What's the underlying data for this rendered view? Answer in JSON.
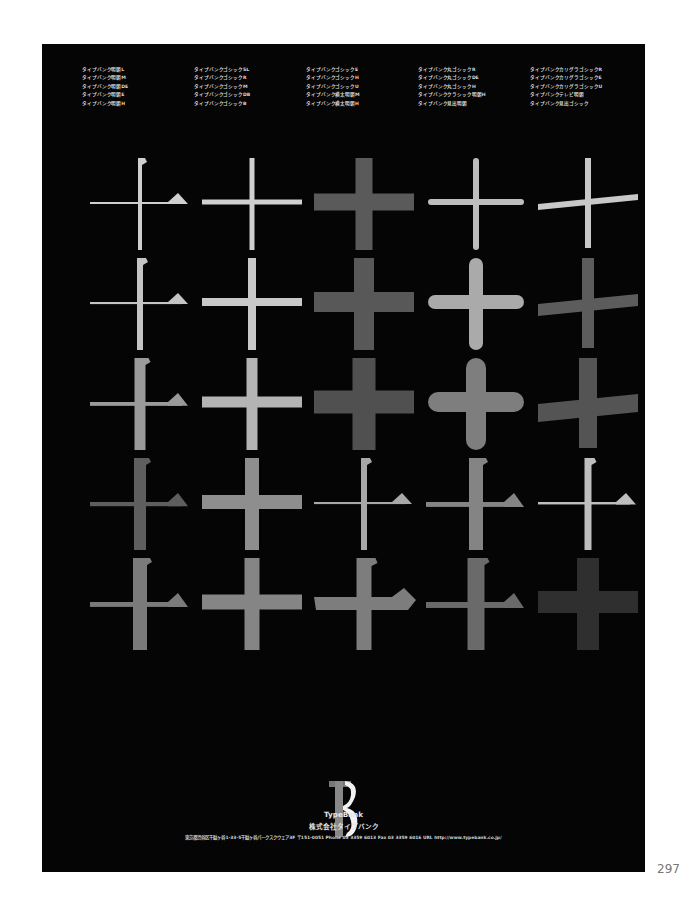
{
  "font_name_columns": [
    [
      "タイプバンク明朝L",
      "タイプバンク明朝M",
      "タイプバンク明朝DE",
      "タイプバンク明朝E",
      "タイプバンク明朝H"
    ],
    [
      "タイプバンクゴシックSL",
      "タイプバンクゴシックR",
      "タイプバンクゴシックM",
      "タイプバンクゴシックDB",
      "タイプバンクゴシックB"
    ],
    [
      "タイプバンクゴシックE",
      "タイプバンクゴシックH",
      "タイプバンクゴシックU",
      "タイプバンク横太明朝M",
      "タイプバンク横太明朝H"
    ],
    [
      "タイプバンク丸ゴシックR",
      "タイプバンク丸ゴシックDE",
      "タイプバンク丸ゴシックH",
      "タイプバンククラシック明朝H",
      "タイプバンク見出明朝"
    ],
    [
      "タイプバンクカリグラゴシックR",
      "タイプバンクカリグラゴシックE",
      "タイプバンクカリグラゴシックU",
      "タイプバンクテレビ明朝",
      "タイプバンク見出ゴシック"
    ]
  ],
  "glyph_char": "十",
  "glyph_grid": [
    [
      {
        "style": "mincho",
        "weight": 4,
        "color": "#cfcfcf"
      },
      {
        "style": "gothic",
        "weight": 5,
        "color": "#d0d0d0"
      },
      {
        "style": "gothic",
        "weight": 17,
        "color": "#5a5a5a"
      },
      {
        "style": "round",
        "weight": 6,
        "color": "#bdbdbd"
      },
      {
        "style": "calli",
        "weight": 6,
        "color": "#c8c8c8"
      }
    ],
    [
      {
        "style": "mincho",
        "weight": 6,
        "color": "#c4c4c4"
      },
      {
        "style": "gothic",
        "weight": 8,
        "color": "#c8c8c8"
      },
      {
        "style": "gothic",
        "weight": 20,
        "color": "#585858"
      },
      {
        "style": "round",
        "weight": 14,
        "color": "#aaaaaa"
      },
      {
        "style": "calli",
        "weight": 12,
        "color": "#5c5c5c"
      }
    ],
    [
      {
        "style": "mincho",
        "weight": 11,
        "color": "#9a9a9a"
      },
      {
        "style": "gothic",
        "weight": 11,
        "color": "#b4b4b4"
      },
      {
        "style": "gothic",
        "weight": 23,
        "color": "#505050"
      },
      {
        "style": "round",
        "weight": 20,
        "color": "#7e7e7e"
      },
      {
        "style": "calli",
        "weight": 18,
        "color": "#545454"
      }
    ],
    [
      {
        "style": "mincho",
        "weight": 12,
        "color": "#5e5e5e"
      },
      {
        "style": "gothic",
        "weight": 14,
        "color": "#8e8e8e"
      },
      {
        "style": "mincho",
        "weight": 6,
        "color": "#a8a8a8"
      },
      {
        "style": "mincho",
        "weight": 14,
        "color": "#848484"
      },
      {
        "style": "mincho",
        "weight": 7,
        "color": "#bebebe"
      }
    ],
    [
      {
        "style": "mincho",
        "weight": 14,
        "color": "#7a7a7a"
      },
      {
        "style": "gothic",
        "weight": 15,
        "color": "#858585"
      },
      {
        "style": "heavymincho",
        "weight": 15,
        "color": "#7d7d7d"
      },
      {
        "style": "mincho",
        "weight": 17,
        "color": "#6a6a6a"
      },
      {
        "style": "gothic",
        "weight": 22,
        "color": "#2f2f2f"
      }
    ]
  ],
  "logo": {
    "mark": "TB",
    "name": "TypeBank",
    "company": "株式会社タイプバンク"
  },
  "address": "東京都渋谷区千駄ヶ谷1-33-5千駄ヶ谷パークスクウェア3F 〒151-0051 Phone 03 3359 6013 Fax 03 3359 6016 URL http://www.typebank.co.jp/",
  "page_number": "297"
}
